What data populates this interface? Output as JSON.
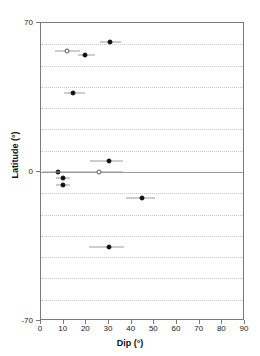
{
  "chart_data": {
    "type": "scatter",
    "title": "",
    "xlabel": "Dip (°)",
    "ylabel": "Latitude (°)",
    "xlim": [
      0,
      90
    ],
    "ylim": [
      -70,
      70
    ],
    "xticks": [
      0,
      10,
      20,
      30,
      40,
      50,
      60,
      70,
      80,
      90
    ],
    "yticks": [
      70,
      0,
      -70
    ],
    "ytick_labels": [
      "70",
      "0",
      "-70"
    ],
    "grid": "horizontal dotted gridlines every 10 degrees latitude, solid line at 0",
    "gridline_values": [
      60,
      50,
      40,
      30,
      20,
      10,
      0,
      -10,
      -20,
      -30,
      -40,
      -50,
      -60
    ],
    "legend": "none",
    "marker_colors": {
      "filled": "#111111",
      "open_edge": "#555555",
      "errorbar": "#9b9b9b"
    },
    "series": [
      {
        "name": "filled",
        "marker": "filled-circle",
        "points": [
          {
            "dip": 30.5,
            "latitude": 61.0,
            "xerr_low": 26.0,
            "xerr_high": 35.5
          },
          {
            "dip": 19.5,
            "latitude": 55.0,
            "xerr_low": 16.5,
            "xerr_high": 24.0
          },
          {
            "dip": 14.0,
            "latitude": 37.0,
            "xerr_low": 10.0,
            "xerr_high": 19.5
          },
          {
            "dip": 30.0,
            "latitude": 5.0,
            "xerr_low": 21.5,
            "xerr_high": 36.0
          },
          {
            "dip": 7.5,
            "latitude": 0.0,
            "xerr_low": 6.5,
            "xerr_high": 8.5
          },
          {
            "dip": 9.5,
            "latitude": -3.0,
            "xerr_low": 6.5,
            "xerr_high": 13.0
          },
          {
            "dip": 9.5,
            "latitude": -6.0,
            "xerr_low": 6.5,
            "xerr_high": 13.0
          },
          {
            "dip": 44.5,
            "latitude": -12.0,
            "xerr_low": 37.5,
            "xerr_high": 50.5
          },
          {
            "dip": 30.0,
            "latitude": -35.0,
            "xerr_low": 21.0,
            "xerr_high": 36.5
          }
        ]
      },
      {
        "name": "open",
        "marker": "open-circle",
        "points": [
          {
            "dip": 11.5,
            "latitude": 57.0,
            "xerr_low": 6.0,
            "xerr_high": 17.0
          },
          {
            "dip": 25.5,
            "latitude": 0.0,
            "xerr_low": 1.0,
            "xerr_high": 36.0
          }
        ]
      }
    ]
  }
}
